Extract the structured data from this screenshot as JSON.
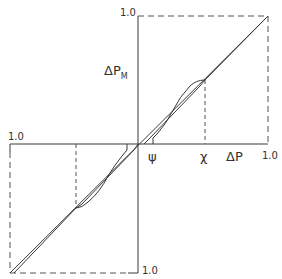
{
  "diagram": {
    "type": "quantization-transfer-characteristic",
    "labels": {
      "top_one": "1.0",
      "left_one": "1.0",
      "right_one": "1.0",
      "bottom_one": "1.0",
      "vertical_axis": "ΔP",
      "vertical_axis_sub": "M",
      "horizontal_axis": "ΔP",
      "psi": "ψ",
      "chi": "χ"
    },
    "colors": {
      "line": "#3a3a3a",
      "dashed": "#555555",
      "background": "#ffffff"
    },
    "axes": {
      "x_range": [
        -1.0,
        1.0
      ],
      "y_range": [
        -1.0,
        1.0
      ]
    },
    "markers": {
      "psi_x": 0.1,
      "chi_x": 0.52
    }
  }
}
